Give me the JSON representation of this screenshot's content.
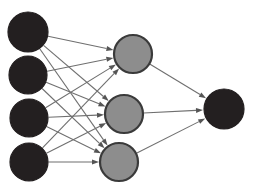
{
  "diagram": {
    "type": "neural-network",
    "title": "",
    "canvas": {
      "width": 256,
      "height": 195,
      "background": "#ffffff"
    },
    "colors": {
      "input_node_fill": "#231f20",
      "input_node_stroke": "#231f20",
      "hidden_node_fill": "#8d8d8d",
      "hidden_node_stroke": "#3a3a3a",
      "output_node_fill": "#231f20",
      "output_node_stroke": "#231f20",
      "edge": "#6f6f6f",
      "arrowhead": "#555555"
    },
    "edge_style": {
      "stroke_width": 1.1,
      "arrowhead": "filled-triangle",
      "arrow_length": 7,
      "arrow_width": 5
    },
    "layers": [
      {
        "name": "input-layer",
        "role": "input",
        "count": 4,
        "nodes": [
          {
            "id": "i1",
            "label": "",
            "cx": 28,
            "cy": 32,
            "r": 20,
            "fill": "#231f20"
          },
          {
            "id": "i2",
            "label": "",
            "cx": 28,
            "cy": 75,
            "r": 19,
            "fill": "#231f20"
          },
          {
            "id": "i3",
            "label": "",
            "cx": 29,
            "cy": 118,
            "r": 19,
            "fill": "#231f20"
          },
          {
            "id": "i4",
            "label": "",
            "cx": 29,
            "cy": 162,
            "r": 19,
            "fill": "#231f20"
          }
        ]
      },
      {
        "name": "hidden-layer",
        "role": "hidden",
        "count": 3,
        "nodes": [
          {
            "id": "h1",
            "label": "",
            "cx": 133,
            "cy": 54,
            "r": 19,
            "fill": "#8d8d8d"
          },
          {
            "id": "h2",
            "label": "",
            "cx": 124,
            "cy": 114,
            "r": 19,
            "fill": "#8d8d8d"
          },
          {
            "id": "h3",
            "label": "",
            "cx": 119,
            "cy": 162,
            "r": 19,
            "fill": "#8d8d8d"
          }
        ]
      },
      {
        "name": "output-layer",
        "role": "output",
        "count": 1,
        "nodes": [
          {
            "id": "o1",
            "label": "",
            "cx": 224,
            "cy": 109,
            "r": 20,
            "fill": "#231f20"
          }
        ]
      }
    ],
    "edges": [
      {
        "from": "i1",
        "to": "h1"
      },
      {
        "from": "i1",
        "to": "h2"
      },
      {
        "from": "i1",
        "to": "h3"
      },
      {
        "from": "i2",
        "to": "h1"
      },
      {
        "from": "i2",
        "to": "h2"
      },
      {
        "from": "i2",
        "to": "h3"
      },
      {
        "from": "i3",
        "to": "h1"
      },
      {
        "from": "i3",
        "to": "h2"
      },
      {
        "from": "i3",
        "to": "h3"
      },
      {
        "from": "i4",
        "to": "h1"
      },
      {
        "from": "i4",
        "to": "h2"
      },
      {
        "from": "i4",
        "to": "h3"
      },
      {
        "from": "h1",
        "to": "o1"
      },
      {
        "from": "h2",
        "to": "o1"
      },
      {
        "from": "h3",
        "to": "o1"
      }
    ]
  }
}
